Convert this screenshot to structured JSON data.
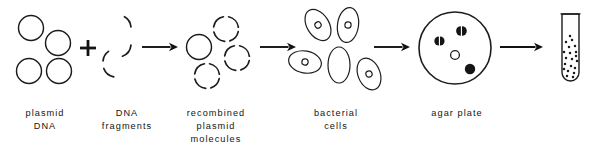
{
  "diagram": {
    "background_color": "#ffffff",
    "ink_color": "#1c1c1c",
    "width": 595,
    "height": 154,
    "steps": [
      {
        "id": "plasmid-dna",
        "label": "plasmid\nDNA",
        "label_lines": [
          "plasmid",
          "DNA"
        ],
        "caption_x": 8,
        "caption_y": 107,
        "caption_width": 74,
        "icon": "open-circles",
        "count": 4
      },
      {
        "id": "dna-fragments",
        "label": "DNA\nfragments",
        "label_lines": [
          "DNA",
          "fragments"
        ],
        "caption_x": 88,
        "caption_y": 107,
        "caption_width": 78,
        "icon": "broken-arc-circle",
        "count": 1
      },
      {
        "id": "recombined-plasmid-molecules",
        "label": "recombined\nplasmid\nmolecules",
        "label_lines": [
          "recombined",
          "plasmid",
          "molecules"
        ],
        "caption_x": 170,
        "caption_y": 107,
        "caption_width": 92,
        "icon": "mixed-circles",
        "count": 4
      },
      {
        "id": "bacterial-cells",
        "label": "bacterial\ncells",
        "label_lines": [
          "bacterial",
          "cells"
        ],
        "caption_x": 294,
        "caption_y": 107,
        "caption_width": 84,
        "icon": "bacterial-cells",
        "count": 5
      },
      {
        "id": "agar-plate",
        "label": "agar plate",
        "label_lines": [
          "agar plate"
        ],
        "caption_x": 408,
        "caption_y": 107,
        "caption_width": 98,
        "icon": "petri-dish",
        "count": 4
      },
      {
        "id": "culture-tube",
        "label": "",
        "label_lines": [],
        "caption_x": 545,
        "caption_y": 107,
        "caption_width": 48,
        "icon": "test-tube",
        "count": 1
      }
    ],
    "operators": [
      {
        "id": "plus",
        "symbol": "+",
        "x": 88,
        "y": 48
      }
    ],
    "arrows": [
      {
        "id": "arrow-1",
        "x1": 142,
        "y1": 47,
        "x2": 178,
        "y2": 47
      },
      {
        "id": "arrow-2",
        "x1": 260,
        "y1": 47,
        "x2": 296,
        "y2": 47
      },
      {
        "id": "arrow-3",
        "x1": 374,
        "y1": 47,
        "x2": 410,
        "y2": 47
      },
      {
        "id": "arrow-4",
        "x1": 500,
        "y1": 47,
        "x2": 543,
        "y2": 47
      }
    ],
    "plasmid_circles": [
      {
        "cx": 31,
        "cy": 28,
        "r": 12.5
      },
      {
        "cx": 58,
        "cy": 43,
        "r": 12.5
      },
      {
        "cx": 29,
        "cy": 71,
        "r": 12.5
      },
      {
        "cx": 59,
        "cy": 71,
        "r": 12.5
      }
    ],
    "fragment_arcs": [
      {
        "cx": 118,
        "cy": 28,
        "r": 13,
        "start": 300,
        "end": 355
      },
      {
        "cx": 118,
        "cy": 44,
        "r": 13,
        "start": 5,
        "end": 70
      },
      {
        "cx": 116,
        "cy": 64,
        "r": 13,
        "start": 100,
        "end": 160
      },
      {
        "cx": 116,
        "cy": 62,
        "r": 13,
        "start": 185,
        "end": 235
      }
    ],
    "recombined_circles": [
      {
        "cx": 199,
        "cy": 47,
        "r": 12.5,
        "style": "solid"
      },
      {
        "cx": 226,
        "cy": 29,
        "r": 12.5,
        "style": "dashed"
      },
      {
        "cx": 237,
        "cy": 58,
        "r": 12.5,
        "style": "dashed"
      },
      {
        "cx": 207,
        "cy": 76,
        "r": 12.5,
        "style": "dashed"
      }
    ],
    "bacterial_cells": [
      {
        "cx": 318,
        "cy": 25,
        "rx": 11,
        "ry": 17,
        "rot": -32,
        "plasmid": true
      },
      {
        "cx": 348,
        "cy": 25,
        "rx": 10.5,
        "ry": 17.5,
        "rot": 8,
        "plasmid": true
      },
      {
        "cx": 305,
        "cy": 62,
        "rx": 16.5,
        "ry": 11,
        "rot": 10,
        "plasmid": true
      },
      {
        "cx": 339,
        "cy": 65,
        "rx": 11,
        "ry": 18,
        "rot": 0,
        "plasmid": false
      },
      {
        "cx": 369,
        "cy": 74,
        "rx": 11,
        "ry": 16.5,
        "rot": -22,
        "plasmid": true
      }
    ],
    "agar_colonies": [
      {
        "cx": 440,
        "cy": 41,
        "r": 4.6,
        "style": "split"
      },
      {
        "cx": 462,
        "cy": 31,
        "r": 4.8,
        "style": "split"
      },
      {
        "cx": 455,
        "cy": 55,
        "r": 4.4,
        "style": "open"
      },
      {
        "cx": 470,
        "cy": 69,
        "r": 5.2,
        "style": "solid"
      }
    ],
    "agar_plate_shape": {
      "cx": 455,
      "cy": 48,
      "r": 36
    },
    "tube_shape": {
      "x": 562,
      "y": 14,
      "w": 17,
      "h": 67,
      "liquid_top": 38
    },
    "tube_dots": [
      [
        566,
        42
      ],
      [
        572,
        40
      ],
      [
        569,
        47
      ],
      [
        575,
        46
      ],
      [
        564,
        52
      ],
      [
        570,
        53
      ],
      [
        576,
        52
      ],
      [
        566,
        58
      ],
      [
        572,
        59
      ],
      [
        577,
        61
      ],
      [
        565,
        64
      ],
      [
        571,
        66
      ],
      [
        575,
        68
      ],
      [
        568,
        71
      ],
      [
        574,
        73
      ],
      [
        567,
        76
      ],
      [
        573,
        77
      ],
      [
        570,
        36
      ],
      [
        576,
        56
      ],
      [
        564,
        69
      ]
    ]
  }
}
